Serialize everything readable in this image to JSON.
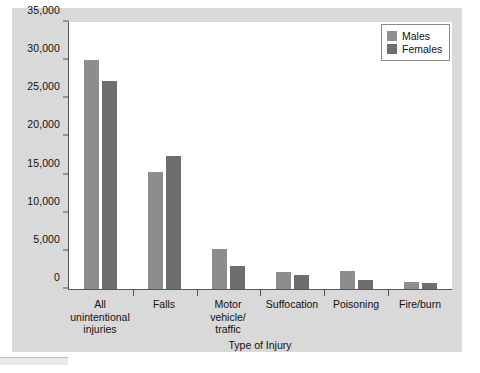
{
  "chart_data": {
    "type": "bar",
    "title": "",
    "xlabel": "Type of Injury",
    "ylabel": "",
    "categories": [
      "All\nunintentional\ninjuries",
      "Falls",
      "Motor\nvehicle/\ntraffic",
      "Suffocation",
      "Poisoning",
      "Fire/burn"
    ],
    "series": [
      {
        "name": "Males",
        "color": "#8d8d8d",
        "values": [
          30000,
          15300,
          5200,
          2200,
          2300,
          900
        ]
      },
      {
        "name": "Females",
        "color": "#6e6e6e",
        "values": [
          27300,
          17400,
          3000,
          1900,
          1200,
          800
        ]
      }
    ],
    "ylim": [
      0,
      35000
    ],
    "ytick_values": [
      0,
      5000,
      10000,
      15000,
      20000,
      25000,
      30000,
      35000
    ],
    "ytick_labels": [
      "0",
      "5,000",
      "10,000",
      "15,000",
      "20,000",
      "25,000",
      "30,000",
      "35,000"
    ],
    "grid": false,
    "legend_position": "top-right"
  },
  "legend": {
    "entries": [
      {
        "label": "Males"
      },
      {
        "label": "Females"
      }
    ]
  },
  "axis": {
    "x_title": "Type of Injury"
  },
  "colors": {
    "males": "#8d8d8d",
    "females": "#6e6e6e",
    "panel_background": "#d9d9d9",
    "plot_background": "#ffffff",
    "axis_line": "#555555"
  }
}
